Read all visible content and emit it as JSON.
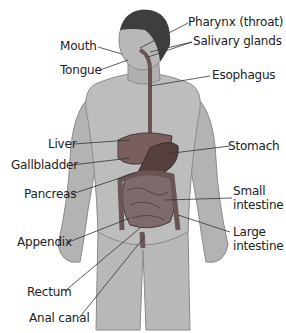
{
  "diagram": {
    "colors": {
      "skin": "#b5b5b5",
      "skin_dark": "#8e8e8e",
      "hair": "#3a3a3a",
      "organ": "#6b5454",
      "liver": "#7a5e5e",
      "stomach": "#5a4444",
      "intestine": "#7d6a6a",
      "line": "#333333"
    },
    "labels": {
      "pharynx": "Pharynx (throat)",
      "salivary": "Salivary glands",
      "mouth": "Mouth",
      "tongue": "Tongue",
      "esophagus": "Esophagus",
      "liver": "Liver",
      "stomach": "Stomach",
      "gallbladder": "Gallbladder",
      "pancreas": "Pancreas",
      "small1": "Small",
      "small2": "intestine",
      "appendix": "Appendix",
      "large1": "Large",
      "large2": "intestine",
      "rectum": "Rectum",
      "anal": "Anal canal"
    }
  }
}
